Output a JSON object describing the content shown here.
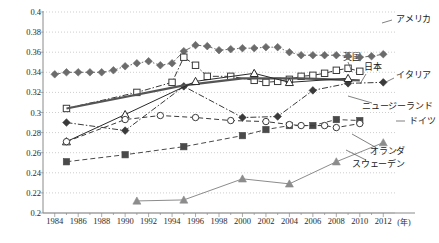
{
  "chart_data": {
    "type": "line",
    "title": "",
    "xlabel": "年",
    "ylabel": "",
    "xlim": [
      1983,
      2013
    ],
    "ylim": [
      0.2,
      0.4
    ],
    "ytick_step": 0.02,
    "grid": true,
    "legend_position": "inline-right-labels",
    "xticks": [
      "1984",
      "1986",
      "1988",
      "1990",
      "1992",
      "1994",
      "1996",
      "1998",
      "2000",
      "2002",
      "2004",
      "2006",
      "2008",
      "2010",
      "2012"
    ],
    "yticks": [
      "0.2",
      "0.22",
      "0.24",
      "0.26",
      "0.28",
      "0.3",
      "0.32",
      "0.34",
      "0.36",
      "0.38",
      "0.4"
    ],
    "x_unit_label": "(年)",
    "series": [
      {
        "name": "アメリカ",
        "label_en": "United States",
        "color": "#6b6b6b",
        "marker": "diamond-filled",
        "linestyle": "dash-dot",
        "x": [
          1984,
          1985,
          1986,
          1987,
          1988,
          1989,
          1990,
          1991,
          1992,
          1993,
          1994,
          1995,
          1996,
          1997,
          1998,
          1999,
          2000,
          2001,
          2002,
          2003,
          2004,
          2005,
          2006,
          2007,
          2008,
          2009,
          2010,
          2011,
          2012
        ],
        "y": [
          0.338,
          0.34,
          0.34,
          0.34,
          0.34,
          0.342,
          0.346,
          0.349,
          0.351,
          0.347,
          0.349,
          0.361,
          0.367,
          0.366,
          0.362,
          0.363,
          0.364,
          0.364,
          0.365,
          0.365,
          0.36,
          0.357,
          0.357,
          0.357,
          0.357,
          0.356,
          0.355,
          0.356,
          0.358
        ]
      },
      {
        "name": "英国",
        "label_en": "United Kingdom",
        "color": "#3a3a3a",
        "marker": "square-open",
        "linestyle": "dash-dot",
        "x": [
          1985,
          1991,
          1994,
          1995,
          1996,
          1997,
          1999,
          2001,
          2002,
          2003,
          2004,
          2005,
          2006,
          2007,
          2008,
          2009,
          2010
        ],
        "y": [
          0.304,
          0.32,
          0.33,
          0.355,
          0.347,
          0.336,
          0.336,
          0.332,
          0.33,
          0.331,
          0.333,
          0.336,
          0.337,
          0.339,
          0.342,
          0.344,
          0.341
        ]
      },
      {
        "name": "日本",
        "label_en": "Japan",
        "color": "#3a3a3a",
        "marker": "diamond-filled",
        "linestyle": "dash-dot",
        "x": [
          1985,
          1990,
          1995,
          2000,
          2003,
          2006,
          2009,
          2012
        ],
        "y": [
          0.29,
          0.282,
          0.326,
          0.295,
          0.296,
          0.322,
          0.329,
          0.33
        ]
      },
      {
        "name": "イタリア",
        "label_en": "Italy",
        "color": "#555555",
        "marker": "none",
        "linestyle": "solid-thick",
        "x": [
          1985,
          1995,
          2000,
          2005,
          2010
        ],
        "y": [
          0.304,
          0.327,
          0.334,
          0.334,
          0.332
        ]
      },
      {
        "name": "ニュージーランド",
        "label_en": "New Zealand",
        "color": "#2a2a2a",
        "marker": "triangle-open",
        "linestyle": "solid",
        "x": [
          1985,
          1990,
          1996,
          2001,
          2004,
          2009
        ],
        "y": [
          0.271,
          0.298,
          0.331,
          0.339,
          0.33,
          0.334
        ]
      },
      {
        "name": "ドイツ",
        "label_en": "Germany",
        "color": "#4a4a4a",
        "marker": "square-filled",
        "linestyle": "dash",
        "x": [
          1985,
          1990,
          1995,
          2000,
          2002,
          2004,
          2006,
          2008,
          2010
        ],
        "y": [
          0.251,
          0.258,
          0.266,
          0.277,
          0.283,
          0.287,
          0.287,
          0.293,
          0.292
        ]
      },
      {
        "name": "オランダ",
        "label_en": "Netherlands",
        "color": "#3a3a3a",
        "marker": "circle-open",
        "linestyle": "dash",
        "x": [
          1985,
          1990,
          1993,
          1996,
          1999,
          2002,
          2004,
          2005,
          2007,
          2008,
          2010
        ],
        "y": [
          0.271,
          0.293,
          0.297,
          0.295,
          0.292,
          0.291,
          0.288,
          0.287,
          0.287,
          0.285,
          0.289
        ]
      },
      {
        "name": "スウェーデン",
        "label_en": "Sweden",
        "color": "#8c8c8c",
        "marker": "triangle-filled",
        "linestyle": "solid",
        "x": [
          1991,
          1995,
          2000,
          2004,
          2008,
          2012
        ],
        "y": [
          0.212,
          0.213,
          0.234,
          0.229,
          0.251,
          0.27
        ]
      }
    ],
    "annotations": [
      {
        "text": "アメリカ",
        "x_px": 396,
        "y_px": 18
      },
      {
        "text": "英国",
        "x_px": 343,
        "y_px": 56
      },
      {
        "text": "日本",
        "x_px": 364,
        "y_px": 66
      },
      {
        "text": "イタリア",
        "x_px": 396,
        "y_px": 74
      },
      {
        "text": "ニュージーランド",
        "x_px": 362,
        "y_px": 105
      },
      {
        "text": "ドイツ",
        "x_px": 409,
        "y_px": 120
      },
      {
        "text": "オランダ",
        "x_px": 370,
        "y_px": 150
      },
      {
        "text": "スウェーデン",
        "x_px": 352,
        "y_px": 163
      }
    ]
  }
}
